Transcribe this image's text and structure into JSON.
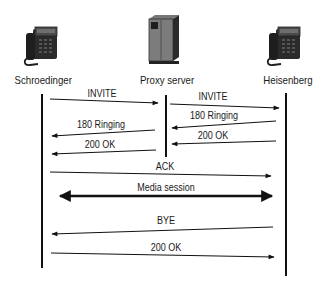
{
  "diagram": {
    "type": "SIP call flow sequence diagram",
    "actors": [
      {
        "id": "schroedinger",
        "label": "Schroedinger",
        "icon": "desk-phone-icon"
      },
      {
        "id": "proxy",
        "label": "Proxy server",
        "icon": "server-tower-icon"
      },
      {
        "id": "heisenberg",
        "label": "Heisenberg",
        "icon": "desk-phone-icon"
      }
    ],
    "messages": [
      {
        "from": "schroedinger",
        "to": "proxy",
        "label": "INVITE"
      },
      {
        "from": "proxy",
        "to": "heisenberg",
        "label": "INVITE"
      },
      {
        "from": "heisenberg",
        "to": "proxy",
        "label": "180 Ringing"
      },
      {
        "from": "proxy",
        "to": "schroedinger",
        "label": "180 Ringing"
      },
      {
        "from": "heisenberg",
        "to": "proxy",
        "label": "200 OK"
      },
      {
        "from": "proxy",
        "to": "schroedinger",
        "label": "200 OK"
      },
      {
        "from": "schroedinger",
        "to": "heisenberg",
        "label": "ACK"
      },
      {
        "from": "schroedinger",
        "to": "heisenberg",
        "label": "Media session",
        "bidirectional": true
      },
      {
        "from": "heisenberg",
        "to": "schroedinger",
        "label": "BYE"
      },
      {
        "from": "schroedinger",
        "to": "heisenberg",
        "label": "200 OK"
      }
    ]
  }
}
